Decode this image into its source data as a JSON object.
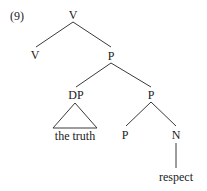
{
  "example_number": "(9)",
  "tree": {
    "root": {
      "label": "V"
    },
    "v_head": {
      "label": "V"
    },
    "p_phrase": {
      "label": "P"
    },
    "dp": {
      "label": "DP",
      "terminal": "the truth"
    },
    "p_bar": {
      "label": "P"
    },
    "p_head": {
      "label": "P"
    },
    "n": {
      "label": "N",
      "terminal": "respect"
    }
  },
  "colors": {
    "text": "#1a1a1a",
    "lines": "#3a3a3a",
    "background": "#ffffff"
  }
}
